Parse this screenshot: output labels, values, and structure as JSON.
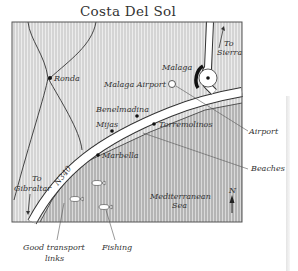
{
  "title": "Costa Del Sol",
  "places": {
    "ronda": "Ronda",
    "malaga": "Malaga",
    "malaga_airport": "Malaga Airport",
    "benelmadina": "Benelmadina",
    "mijas": "Mijas",
    "torremolinos": "Torremolinos",
    "marbella": "Marbella"
  },
  "directions": {
    "to_sierra_1": "To",
    "to_sierra_2": "Sierra",
    "to_gibraltar_1": "To",
    "to_gibraltar_2": "Gibraltar"
  },
  "road": "N340",
  "sea": {
    "line1": "Mediterranean",
    "line2": "Sea"
  },
  "north": "N",
  "annotations": {
    "airport": "Airport",
    "beaches": "Beaches",
    "transport_1": "Good transport",
    "transport_2": "links",
    "fishing": "Fishing"
  },
  "colors": {
    "land": "#d2d2d2",
    "sea": "#b8b8b8",
    "road": "#ffffff",
    "ink": "#333333"
  }
}
